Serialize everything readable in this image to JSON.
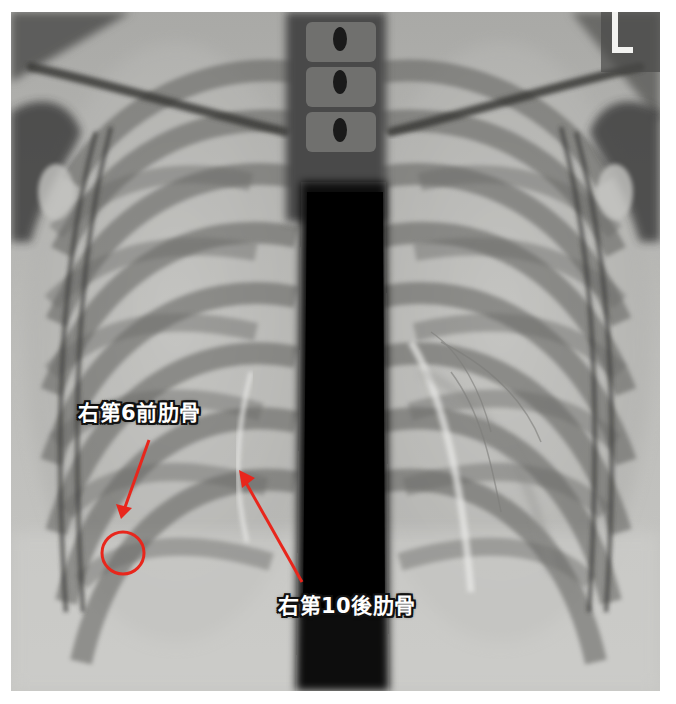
{
  "figure": {
    "type": "chest-xray-pa",
    "side_marker": "L",
    "colors": {
      "annotation_red": "#e8261c",
      "label_text": "#ffffff",
      "label_outline": "#111111",
      "film_background": "#b9b9b6",
      "mediastinum": "#0b0b0b"
    }
  },
  "annotations": [
    {
      "id": "right-6th-anterior-rib",
      "label": "右第6前肋骨",
      "label_box": {
        "x": 78,
        "y": 403
      },
      "arrow": {
        "from": [
          149,
          440
        ],
        "to": [
          122,
          516
        ]
      },
      "circle": {
        "cx": 123,
        "cy": 553,
        "r": 21
      }
    },
    {
      "id": "right-10th-posterior-rib",
      "label": "右第10後肋骨",
      "label_box": {
        "x": 278,
        "y": 596
      },
      "arrow": {
        "from": [
          302,
          582
        ],
        "to": [
          239,
          471
        ]
      }
    }
  ]
}
